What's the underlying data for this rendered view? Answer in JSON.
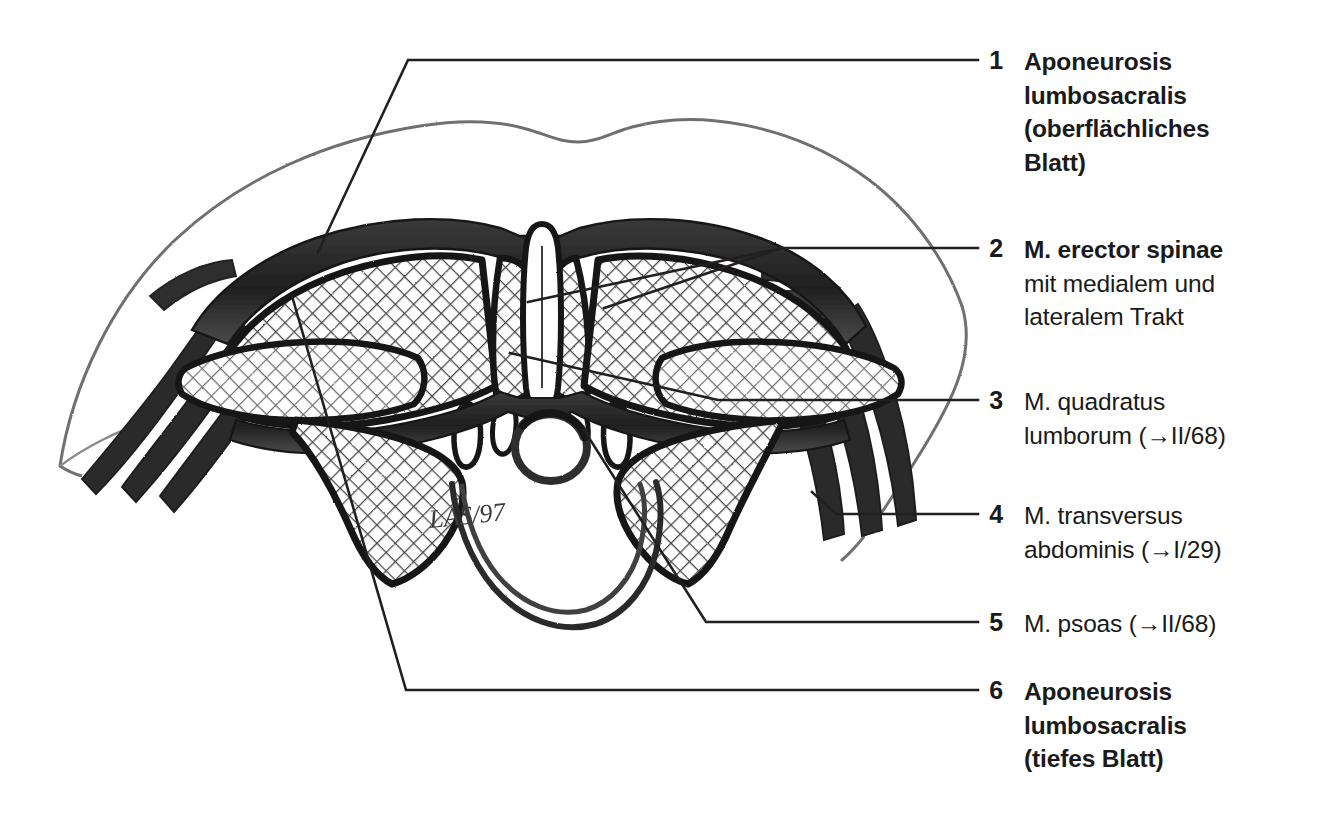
{
  "figure": {
    "kind": "anatomical-cross-section",
    "region": "Lumbale Rumpfwand – Querschnitt",
    "signature": "LAS/97",
    "background_color": "#ffffff",
    "ink_color": "#1a1a1a",
    "line_color": "#231f20"
  },
  "legend": {
    "items": [
      {
        "number": "1",
        "label_line1": "Aponeurosis",
        "label_line2": "lumbosacralis",
        "label_line3": "(oberflächliches",
        "label_line4": "Blatt)",
        "style": "bold",
        "full_text": "Aponeurosis\nlumbosacralis\n(oberflächliches\nBlatt)"
      },
      {
        "number": "2",
        "label_line1": "M. erector spinae",
        "label_line2": "mit medialem und",
        "label_line3": "lateralem Trakt",
        "style": "bold-first-line",
        "head": "M. erector spinae",
        "tail": "mit medialem und\nlateralem Trakt"
      },
      {
        "number": "3",
        "label_line1": "M. quadratus",
        "label_line2": "lumborum (→II/68)",
        "style": "regular",
        "full_text": "M. quadratus\nlumborum (→II/68)"
      },
      {
        "number": "4",
        "label_line1": "M. transversus",
        "label_line2": "abdominis (→I/29)",
        "style": "regular",
        "full_text": "M. transversus\nabdominis (→I/29)"
      },
      {
        "number": "5",
        "label_line1": "M. psoas (→II/68)",
        "style": "regular",
        "full_text": "M. psoas (→II/68)"
      },
      {
        "number": "6",
        "label_line1": "Aponeurosis",
        "label_line2": "lumbosacralis",
        "label_line3": "(tiefes Blatt)",
        "style": "bold",
        "full_text": "Aponeurosis\nlumbosacralis\n(tiefes Blatt)"
      }
    ]
  },
  "drawing": {
    "signature_text": "LAS/97",
    "structures": [
      "Aponeurosis lumbosacralis (oberflächliches Blatt)",
      "M. erector spinae – medialer Trakt",
      "M. erector spinae – lateraler Trakt",
      "M. quadratus lumborum",
      "M. transversus abdominis",
      "M. obliquus internus abdominis",
      "M. obliquus externus abdominis",
      "M. psoas",
      "Aponeurosis lumbosacralis (tiefes Blatt)",
      "Processus spinosus",
      "Canalis vertebralis",
      "Corpus vertebrae"
    ]
  }
}
